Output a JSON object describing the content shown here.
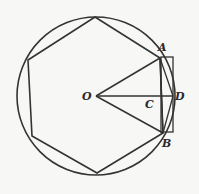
{
  "labels": {
    "O": "O",
    "A": "A",
    "B": "B",
    "C": "C",
    "D": "D"
  },
  "colors": {
    "stroke": "#333333",
    "background": "#f7f7f5"
  },
  "geometry": {
    "circle": {
      "cx": 96,
      "cy": 96,
      "r": 79
    },
    "hexagon": [
      [
        95,
        17
      ],
      [
        160,
        58
      ],
      [
        163,
        133
      ],
      [
        97,
        173
      ],
      [
        32,
        136
      ],
      [
        28,
        60
      ]
    ],
    "points": {
      "O": [
        96,
        96
      ],
      "A": [
        160,
        58
      ],
      "B": [
        163,
        133
      ],
      "C": [
        161,
        96
      ],
      "D": [
        173,
        96
      ]
    },
    "rectangle": {
      "x": 161,
      "y": 57,
      "w": 12,
      "h": 75
    }
  }
}
